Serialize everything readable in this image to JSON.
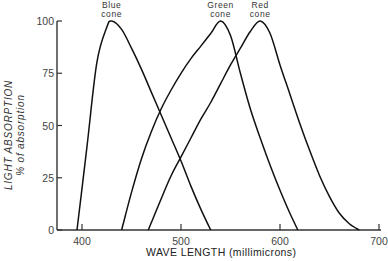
{
  "chart_data": {
    "type": "line",
    "title": "",
    "xlabel": "WAVE LENGTH (millimicrons)",
    "ylabel": "LIGHT ABSORPTION",
    "ylabel_sub": "% of absorption",
    "xlim": [
      380,
      700
    ],
    "ylim": [
      0,
      100
    ],
    "x_ticks": [
      400,
      500,
      600,
      700
    ],
    "x_tick_labels": [
      "400",
      "500",
      "600",
      "700"
    ],
    "y_ticks": [
      0,
      25,
      50,
      75,
      100
    ],
    "y_tick_labels": [
      "0",
      "25",
      "50",
      "75",
      "100"
    ],
    "grid": false,
    "legend": "inline labels above peaks",
    "series": [
      {
        "name": "Blue cone",
        "label_lines": [
          "Blue",
          "cone"
        ],
        "x": [
          395,
          405,
          415,
          425,
          430,
          440,
          450,
          460,
          470,
          480,
          490,
          500,
          510,
          520,
          530
        ],
        "values": [
          0,
          40,
          80,
          97,
          100,
          96,
          87,
          77,
          66,
          55,
          44,
          33,
          21,
          10,
          0
        ]
      },
      {
        "name": "Green cone",
        "label_lines": [
          "Green",
          "cone"
        ],
        "x": [
          440,
          450,
          460,
          470,
          480,
          490,
          500,
          510,
          520,
          530,
          540,
          550,
          560,
          570,
          580,
          590,
          600,
          610,
          618
        ],
        "values": [
          0,
          18,
          34,
          47,
          58,
          67,
          75,
          82,
          88,
          94,
          100,
          93,
          75,
          58,
          44,
          31,
          19,
          8,
          0
        ]
      },
      {
        "name": "Red cone",
        "label_lines": [
          "Red",
          "cone"
        ],
        "x": [
          467,
          480,
          490,
          500,
          510,
          520,
          530,
          540,
          550,
          560,
          570,
          580,
          590,
          600,
          610,
          620,
          630,
          640,
          650,
          660,
          670,
          680
        ],
        "values": [
          0,
          15,
          26,
          35,
          44,
          53,
          61,
          70,
          79,
          87,
          95,
          100,
          94,
          79,
          65,
          51,
          38,
          26,
          16,
          8,
          3,
          0
        ]
      }
    ]
  }
}
